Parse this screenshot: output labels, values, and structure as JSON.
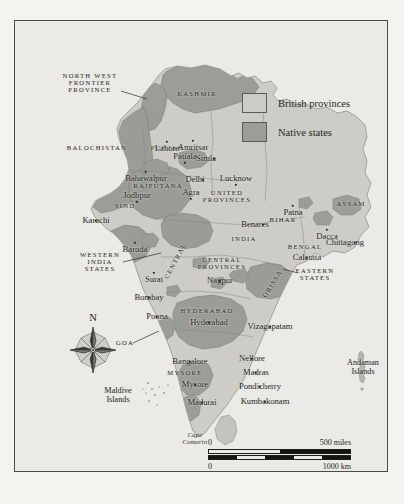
{
  "figure": {
    "title": "The British Raj and Princely States, 1907"
  },
  "legend": {
    "items": [
      {
        "label": "British provinces",
        "color": "#cdccc7",
        "key": "british-provinces"
      },
      {
        "label": "Native states",
        "color": "#9d9d97",
        "key": "native-states"
      }
    ]
  },
  "compass": {
    "north_label": "N",
    "icon": "compass-rose-icon"
  },
  "scalebar": {
    "miles": {
      "start": "0",
      "end": "500 miles"
    },
    "km": {
      "start": "0",
      "end": "1000 km"
    }
  },
  "map_labels": {
    "provinces": [
      {
        "text": "NORTH WEST\nFRONTIER\nPROVINCE",
        "x": 75,
        "y": 62,
        "leader": true
      },
      {
        "text": "KASHMIR",
        "x": 182,
        "y": 73
      },
      {
        "text": "BALOCHISTAN",
        "x": 82,
        "y": 127
      },
      {
        "text": "PUNJAB",
        "x": 152,
        "y": 127
      },
      {
        "text": "RAJPUTANA",
        "x": 143,
        "y": 165
      },
      {
        "text": "SIND",
        "x": 110,
        "y": 185
      },
      {
        "text": "UNITED\nPROVINCES",
        "x": 212,
        "y": 176
      },
      {
        "text": "BIHAR",
        "x": 268,
        "y": 199
      },
      {
        "text": "ASSAM",
        "x": 336,
        "y": 183
      },
      {
        "text": "BENGAL",
        "x": 290,
        "y": 226
      },
      {
        "text": "CENTRAL\nPROVINCES",
        "x": 207,
        "y": 243
      },
      {
        "text": "HYDERABAD",
        "x": 192,
        "y": 290
      },
      {
        "text": "MYSORE",
        "x": 170,
        "y": 352
      },
      {
        "text": "WESTERN\nINDIA\nSTATES",
        "x": 85,
        "y": 241
      },
      {
        "text": "EASTERN\nSTATES",
        "x": 300,
        "y": 254
      },
      {
        "text": "GOA",
        "x": 110,
        "y": 322,
        "leader": true
      },
      {
        "text": "CENTRAL",
        "x": 161,
        "y": 240,
        "rotate": -62
      },
      {
        "text": "ORISSA",
        "x": 258,
        "y": 263,
        "rotate": -58
      },
      {
        "text": "INDIA",
        "x": 229,
        "y": 218
      }
    ],
    "cities": [
      {
        "text": "Lahore",
        "x": 152,
        "y": 121,
        "dx": 0,
        "dy": 7
      },
      {
        "text": "Amritsar",
        "x": 178,
        "y": 120,
        "dx": 0,
        "dy": 7
      },
      {
        "text": "Simla",
        "x": 199,
        "y": 138,
        "dx": -8,
        "dy": 0
      },
      {
        "text": "Patiala",
        "x": 170,
        "y": 142,
        "dx": 0,
        "dy": -6
      },
      {
        "text": "Delhi",
        "x": 188,
        "y": 159,
        "dx": -8,
        "dy": 0
      },
      {
        "text": "Bahawalpur",
        "x": 131,
        "y": 151,
        "dx": 0,
        "dy": 7
      },
      {
        "text": "Lucknow",
        "x": 221,
        "y": 164,
        "dx": 0,
        "dy": -6
      },
      {
        "text": "Agra",
        "x": 176,
        "y": 178,
        "dx": 0,
        "dy": -6
      },
      {
        "text": "Jodhpur",
        "x": 122,
        "y": 181,
        "dx": 0,
        "dy": -6
      },
      {
        "text": "Karachi",
        "x": 81,
        "y": 200,
        "dx": 0,
        "dy": 0
      },
      {
        "text": "Benares",
        "x": 248,
        "y": 204,
        "dx": -8,
        "dy": 0
      },
      {
        "text": "Patna",
        "x": 278,
        "y": 185,
        "dx": 0,
        "dy": 7
      },
      {
        "text": "Dacca",
        "x": 312,
        "y": 209,
        "dx": 0,
        "dy": 7
      },
      {
        "text": "Calcutta",
        "x": 292,
        "y": 237,
        "dx": 0,
        "dy": 0
      },
      {
        "text": "Chittagong",
        "x": 340,
        "y": 222,
        "dx": -10,
        "dy": 0
      },
      {
        "text": "Baroda",
        "x": 120,
        "y": 222,
        "dx": 0,
        "dy": 7
      },
      {
        "text": "Surat",
        "x": 139,
        "y": 252,
        "dx": 0,
        "dy": 7
      },
      {
        "text": "Bombay",
        "x": 134,
        "y": 277,
        "dx": 0,
        "dy": 0
      },
      {
        "text": "Poona",
        "x": 142,
        "y": 296,
        "dx": 0,
        "dy": 0
      },
      {
        "text": "Nagpur",
        "x": 205,
        "y": 260,
        "dx": 0,
        "dy": 0
      },
      {
        "text": "Hyderabad",
        "x": 194,
        "y": 302,
        "dx": 0,
        "dy": 0
      },
      {
        "text": "Vizagapatam",
        "x": 255,
        "y": 306,
        "dx": 0,
        "dy": 0
      },
      {
        "text": "Bangalore",
        "x": 175,
        "y": 341,
        "dx": 0,
        "dy": 0
      },
      {
        "text": "Nellore",
        "x": 237,
        "y": 338,
        "dx": 0,
        "dy": 0
      },
      {
        "text": "Madras",
        "x": 241,
        "y": 352,
        "dx": 0,
        "dy": 0
      },
      {
        "text": "Mysore",
        "x": 180,
        "y": 364,
        "dx": 0,
        "dy": 0
      },
      {
        "text": "Pondicherry",
        "x": 245,
        "y": 366,
        "dx": 0,
        "dy": 0
      },
      {
        "text": "Madurai",
        "x": 187,
        "y": 382,
        "dx": 0,
        "dy": 0
      },
      {
        "text": "Kumbakonam",
        "x": 250,
        "y": 381,
        "dx": 0,
        "dy": 0
      }
    ],
    "islands": [
      {
        "text": "Andaman\nIslands",
        "x": 348,
        "y": 347
      },
      {
        "text": "Maldive\nIslands",
        "x": 103,
        "y": 375
      }
    ],
    "capes": [
      {
        "text": "Cape\nComorin",
        "x": 180,
        "y": 418
      }
    ]
  }
}
